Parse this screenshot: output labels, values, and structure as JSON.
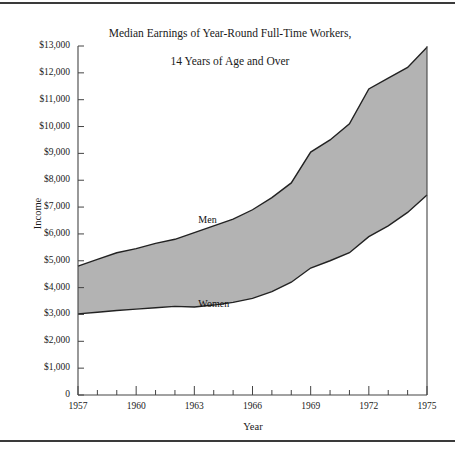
{
  "figure": {
    "title": "Median Earnings of Year-Round Full-Time Workers,\n14 Years of Age and Over",
    "title_line1": "Median Earnings of Year-Round Full-Time Workers,",
    "title_line2": "14 Years of Age and Over",
    "background_color": "#ffffff",
    "rule_color": "#3a3a3a",
    "band_fill_color": "#b3b3b3",
    "line_color": "#222222"
  },
  "chart_data": {
    "type": "area",
    "title": "Median Earnings of Year-Round Full-Time Workers, 14 Years of Age and Over",
    "xlabel": "Year",
    "ylabel": "Income",
    "xlim": [
      1957,
      1975
    ],
    "ylim": [
      0,
      13000
    ],
    "grid": false,
    "legend": "inline-annotations",
    "x": [
      1957,
      1958,
      1959,
      1960,
      1961,
      1962,
      1963,
      1964,
      1965,
      1966,
      1967,
      1968,
      1969,
      1970,
      1971,
      1972,
      1973,
      1974,
      1975
    ],
    "series": [
      {
        "name": "Men",
        "label_position": {
          "x": 1963,
          "y": 6500
        },
        "values": [
          4800,
          5050,
          5300,
          5450,
          5650,
          5800,
          6050,
          6300,
          6550,
          6900,
          7350,
          7900,
          9050,
          9500,
          10100,
          11400,
          11800,
          12200,
          12950
        ]
      },
      {
        "name": "Women",
        "label_position": {
          "x": 1963,
          "y": 3350
        },
        "values": [
          3020,
          3080,
          3150,
          3200,
          3250,
          3300,
          3280,
          3350,
          3450,
          3600,
          3850,
          4200,
          4730,
          5000,
          5300,
          5900,
          6300,
          6800,
          7450
        ]
      }
    ],
    "y_ticks": [
      0,
      1000,
      2000,
      3000,
      4000,
      5000,
      6000,
      7000,
      8000,
      9000,
      10000,
      11000,
      12000,
      13000
    ],
    "y_tick_labels": [
      "0",
      "$1,000",
      "$2,000",
      "$3,000",
      "$4,000",
      "$5,000",
      "$6,000",
      "$7,000",
      "$8,000",
      "$9,000",
      "$10,000",
      "$11,000",
      "$12,000",
      "$13,000"
    ],
    "x_ticks_major": [
      1957,
      1960,
      1963,
      1966,
      1969,
      1972,
      1975
    ],
    "x_tick_labels": [
      "1957",
      "1960",
      "1963",
      "1966",
      "1969",
      "1972",
      "1975"
    ],
    "x_ticks_minor": [
      1958,
      1959,
      1961,
      1962,
      1964,
      1965,
      1967,
      1968,
      1970,
      1971,
      1973,
      1974
    ]
  }
}
